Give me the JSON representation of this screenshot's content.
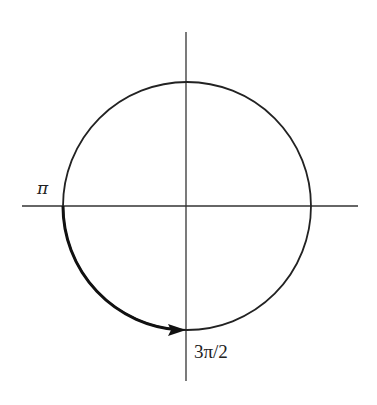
{
  "diagram": {
    "labels": {
      "left_point": "π",
      "bottom_point": "3π/2"
    },
    "geometry": {
      "center": [
        187,
        206
      ],
      "radius": 124,
      "x_axis": [
        22,
        358
      ],
      "y_axis": [
        32,
        381
      ]
    },
    "arc": {
      "from": "π",
      "to": "3π/2",
      "direction": "counterclockwise",
      "arrowhead": "at 3π/2"
    },
    "colors": {
      "stroke": "#222222",
      "background": "#ffffff"
    }
  }
}
